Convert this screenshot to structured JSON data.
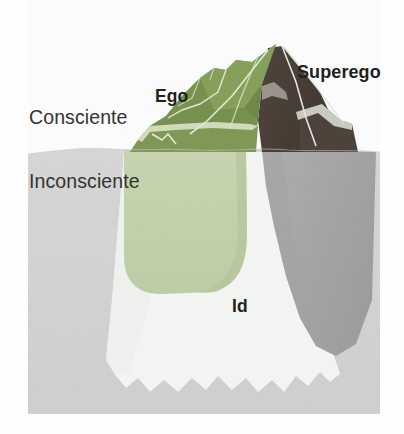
{
  "figure": {
    "type": "freudian-iceberg-diagram",
    "language": "es",
    "labels": {
      "conscious": "Consciente",
      "unconscious": "Inconsciente",
      "ego": "Ego",
      "superego": "Superego",
      "id": "Id"
    },
    "colors": {
      "background": "#fefefe",
      "water": "#d3d3d3",
      "water_shadow": "#c9c9c9",
      "ego_above": "#76904e",
      "ego_above_light": "#88a05d",
      "ego_above_dark": "#627c3f",
      "ego_below": "#c2d0ab",
      "superego_above": "#453b33",
      "superego_above_light": "#5a4e44",
      "superego_below": "#a7a7a7",
      "superego_below_dark": "#9b9b9b",
      "id_below": "#f4f6f3",
      "outline": "#e8eee0",
      "text": "#2b2b2b"
    },
    "geometry": {
      "waterline_y": 152,
      "frame": {
        "x": 28,
        "y": 0,
        "width": 352,
        "height": 414
      }
    }
  }
}
